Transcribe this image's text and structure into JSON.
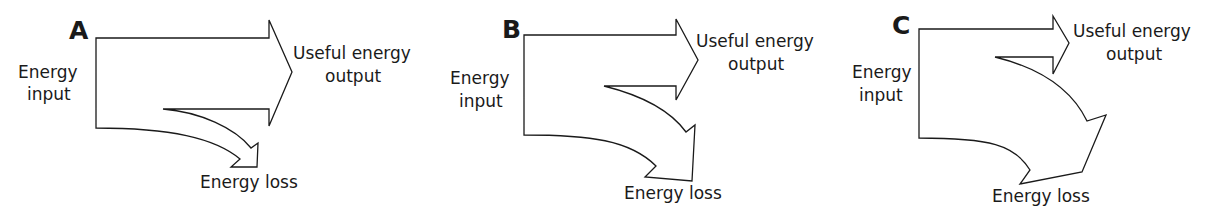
{
  "diagrams": [
    {
      "letter": "A",
      "input_label_line1": "Energy",
      "input_label_line2": "input",
      "useful_label_line1": "Useful energy",
      "useful_label_line2": "output",
      "loss_label": "Energy loss"
    },
    {
      "letter": "B",
      "input_label_line1": "Energy",
      "input_label_line2": "input",
      "useful_label_line1": "Useful energy",
      "useful_label_line2": "output",
      "loss_label": "Energy loss"
    },
    {
      "letter": "C",
      "input_label_line1": "Energy",
      "input_label_line2": "input",
      "useful_label_line1": "Useful energy",
      "useful_label_line2": "output",
      "loss_label": "Energy loss"
    }
  ],
  "colors": {
    "stroke": "#1a1a1a",
    "fill": "#ffffff",
    "text": "#1a1a1a"
  }
}
